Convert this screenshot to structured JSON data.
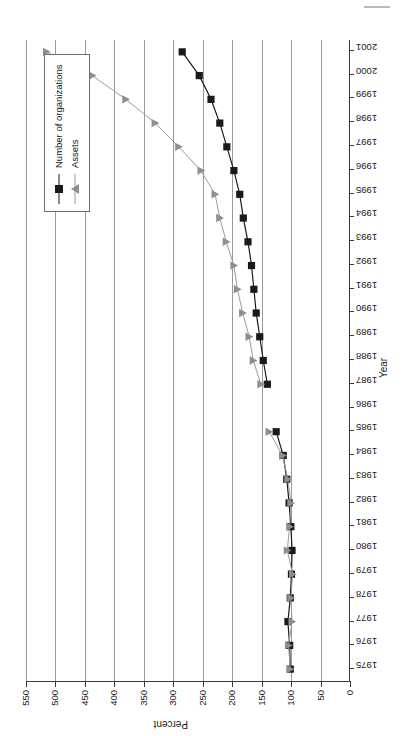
{
  "chart_data": {
    "type": "line",
    "title": "",
    "xlabel": "Year",
    "ylabel": "Percent",
    "ylim": [
      0,
      550
    ],
    "xlim": [
      1975,
      2001
    ],
    "yticks": [
      0,
      50,
      100,
      150,
      200,
      250,
      300,
      350,
      400,
      450,
      500,
      550
    ],
    "grid": "horizontal-value-gridlines",
    "legend_position": "upper-right-inside",
    "orientation": "page-rotated-90-ccw",
    "categories": [
      1975,
      1976,
      1977,
      1978,
      1979,
      1980,
      1981,
      1982,
      1983,
      1984,
      1985,
      1986,
      1987,
      1988,
      1989,
      1990,
      1991,
      1992,
      1993,
      1994,
      1995,
      1996,
      1997,
      1998,
      1999,
      2000,
      2001
    ],
    "x": [
      1975,
      1976,
      1977,
      1978,
      1979,
      1980,
      1981,
      1982,
      1983,
      1984,
      1985,
      1986,
      1987,
      1988,
      1989,
      1990,
      1991,
      1992,
      1993,
      1994,
      1995,
      1996,
      1997,
      1998,
      1999,
      2000,
      2001
    ],
    "series": [
      {
        "name": "Number of organizations",
        "color": "#1a1a1a",
        "marker": "square",
        "values": [
          100,
          101,
          104,
          100,
          98,
          97,
          99,
          102,
          106,
          112,
          124,
          null,
          139,
          146,
          152,
          158,
          162,
          166,
          172,
          180,
          186,
          196,
          208,
          220,
          235,
          255,
          284
        ]
      },
      {
        "name": "Assets",
        "color": "#9a9a9a",
        "marker": "triangle",
        "values": [
          100,
          103,
          97,
          99,
          96,
          105,
          101,
          99,
          104,
          113,
          136,
          null,
          150,
          163,
          170,
          181,
          190,
          196,
          209,
          220,
          228,
          252,
          290,
          330,
          380,
          437,
          515
        ]
      }
    ]
  },
  "axes": {
    "y_title": "Percent",
    "x_title": "Year",
    "y_tick_labels": [
      "550",
      "500",
      "450",
      "400",
      "350",
      "300",
      "250",
      "200",
      "150",
      "100",
      "50",
      "0"
    ],
    "x_tick_labels": [
      "1975",
      "1976",
      "1977",
      "1978",
      "1979",
      "1980",
      "1981",
      "1982",
      "1983",
      "1984",
      "1985",
      "1986",
      "1987",
      "1988",
      "1989",
      "1990",
      "1991",
      "1992",
      "1993",
      "1994",
      "1995",
      "1996",
      "1997",
      "1998",
      "1999",
      "2000",
      "2001"
    ]
  },
  "legend": {
    "entries": [
      {
        "label": "Number of organizations",
        "marker": "square-marker",
        "color": "#1a1a1a"
      },
      {
        "label": "Assets",
        "marker": "triangle-marker",
        "color": "#9a9a9a"
      }
    ]
  }
}
